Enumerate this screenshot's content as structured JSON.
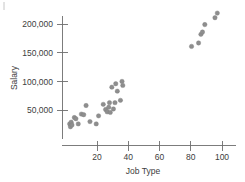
{
  "chart_data": {
    "type": "scatter",
    "title": "",
    "xlabel": "Job Type",
    "ylabel": "Salary",
    "xlim": [
      0,
      104
    ],
    "ylim": [
      0,
      232000
    ],
    "grid": false,
    "legend": null,
    "xticks": [
      20,
      40,
      60,
      80,
      100
    ],
    "xtick_labels": [
      "20",
      "40",
      "60",
      "80",
      "100"
    ],
    "yticks": [
      50000,
      100000,
      150000,
      200000
    ],
    "ytick_labels": [
      "50,000",
      "100,000",
      "150,000",
      "200,000"
    ],
    "marker_color": "#8e8e8e",
    "points": [
      {
        "x": 2.5,
        "y": 26000
      },
      {
        "x": 3.0,
        "y": 21000
      },
      {
        "x": 3.5,
        "y": 29000
      },
      {
        "x": 4.0,
        "y": 24000
      },
      {
        "x": 5.5,
        "y": 37000
      },
      {
        "x": 6.5,
        "y": 35000
      },
      {
        "x": 8.0,
        "y": 26000
      },
      {
        "x": 10.0,
        "y": 43000
      },
      {
        "x": 11.5,
        "y": 42000
      },
      {
        "x": 13.0,
        "y": 58000
      },
      {
        "x": 15.5,
        "y": 30000
      },
      {
        "x": 19.5,
        "y": 26000
      },
      {
        "x": 21.0,
        "y": 40000
      },
      {
        "x": 24.0,
        "y": 60000
      },
      {
        "x": 25.5,
        "y": 51000
      },
      {
        "x": 26.5,
        "y": 47000
      },
      {
        "x": 27.5,
        "y": 55000
      },
      {
        "x": 28.0,
        "y": 63000
      },
      {
        "x": 28.5,
        "y": 46000
      },
      {
        "x": 29.5,
        "y": 90000
      },
      {
        "x": 30.5,
        "y": 52000
      },
      {
        "x": 31.5,
        "y": 63000
      },
      {
        "x": 32.0,
        "y": 96000
      },
      {
        "x": 33.0,
        "y": 83000
      },
      {
        "x": 35.0,
        "y": 67000
      },
      {
        "x": 36.0,
        "y": 100000
      },
      {
        "x": 36.5,
        "y": 93000
      },
      {
        "x": 80.5,
        "y": 161000
      },
      {
        "x": 85.0,
        "y": 167000
      },
      {
        "x": 86.5,
        "y": 182000
      },
      {
        "x": 87.5,
        "y": 186000
      },
      {
        "x": 89.0,
        "y": 199000
      },
      {
        "x": 95.5,
        "y": 211000
      },
      {
        "x": 97.0,
        "y": 219000
      }
    ]
  }
}
